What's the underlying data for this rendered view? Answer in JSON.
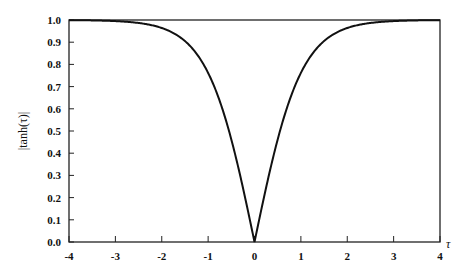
{
  "chart_data": {
    "type": "line",
    "title": "",
    "xlabel": "τ",
    "ylabel": "|tanh(τ)|",
    "xlim": [
      -4,
      4
    ],
    "ylim": [
      0.0,
      1.0
    ],
    "grid": false,
    "legend": null,
    "x_ticks": [
      "-4",
      "-3",
      "-2",
      "-1",
      "0",
      "1",
      "2",
      "3",
      "4"
    ],
    "y_ticks": [
      "0.0",
      "0.1",
      "0.2",
      "0.3",
      "0.4",
      "0.5",
      "0.6",
      "0.7",
      "0.8",
      "0.9",
      "1.0"
    ],
    "series": [
      {
        "name": "|tanh(τ)|",
        "x": [
          -4,
          -3.5,
          -3,
          -2.5,
          -2,
          -1.5,
          -1,
          -0.75,
          -0.5,
          -0.25,
          0,
          0.25,
          0.5,
          0.75,
          1,
          1.5,
          2,
          2.5,
          3,
          3.5,
          4
        ],
        "values": [
          1.0,
          0.998,
          0.995,
          0.987,
          0.964,
          0.905,
          0.762,
          0.635,
          0.462,
          0.245,
          0.0,
          0.245,
          0.462,
          0.635,
          0.762,
          0.905,
          0.964,
          0.987,
          0.995,
          0.998,
          1.0
        ]
      }
    ]
  },
  "axes": {
    "xlabel": "τ",
    "ylabel": "|tanh(τ)|"
  }
}
